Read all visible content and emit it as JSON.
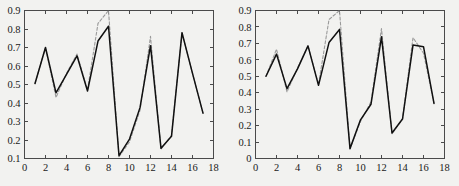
{
  "figure": {
    "background_color": "#f2f2f0",
    "panel_count": 2,
    "solid_color": "#111111",
    "dashed_color": "#9a9a9a"
  },
  "chart_data": [
    {
      "type": "line",
      "panel": "left",
      "title": "",
      "xlabel": "",
      "ylabel": "",
      "xlim": [
        0,
        18
      ],
      "ylim": [
        0.1,
        0.9
      ],
      "xticks": [
        0,
        2,
        4,
        6,
        8,
        10,
        12,
        14,
        16,
        18
      ],
      "xticklabels": [
        "0",
        "2",
        "4",
        "6",
        "8",
        "10",
        "12",
        "14",
        "16",
        "18"
      ],
      "yticks": [
        0.1,
        0.2,
        0.3,
        0.4,
        0.5,
        0.6,
        0.7,
        0.8,
        0.9
      ],
      "yticklabels": [
        "0.1",
        "0.2",
        "0.3",
        "0.4",
        "0.5",
        "0.6",
        "0.7",
        "0.8",
        "0.9"
      ],
      "grid": false,
      "legend": "none",
      "x": [
        1,
        2,
        3,
        4,
        5,
        6,
        7,
        8,
        9,
        10,
        11,
        12,
        13,
        14,
        15,
        16,
        17
      ],
      "series": [
        {
          "name": "solid",
          "style": "solid",
          "color": "#111111",
          "values": [
            0.505,
            0.7,
            0.455,
            0.555,
            0.655,
            0.465,
            0.735,
            0.815,
            0.115,
            0.205,
            0.375,
            0.71,
            0.155,
            0.22,
            0.78,
            0.56,
            0.345
          ]
        },
        {
          "name": "dashed",
          "style": "dashed",
          "color": "#9a9a9a",
          "values": [
            0.505,
            0.7,
            0.43,
            0.56,
            0.665,
            0.47,
            0.83,
            0.9,
            0.11,
            0.19,
            0.36,
            0.76,
            0.15,
            0.225,
            0.78,
            0.56,
            0.345
          ],
          "clipped_above": 0.9,
          "clipped_range_x": [
            7,
            8
          ]
        }
      ]
    },
    {
      "type": "line",
      "panel": "right",
      "title": "",
      "xlabel": "",
      "ylabel": "",
      "xlim": [
        0,
        18
      ],
      "ylim": [
        0,
        0.9
      ],
      "xticks": [
        0,
        2,
        4,
        6,
        8,
        10,
        12,
        14,
        16,
        18
      ],
      "xticklabels": [
        "0",
        "2",
        "4",
        "6",
        "8",
        "10",
        "12",
        "14",
        "16",
        "18"
      ],
      "yticks": [
        0,
        0.1,
        0.2,
        0.3,
        0.4,
        0.5,
        0.6,
        0.7,
        0.8,
        0.9
      ],
      "yticklabels": [
        "0",
        "0.1",
        "0.2",
        "0.3",
        "0.4",
        "0.5",
        "0.6",
        "0.7",
        "0.8",
        "0.9"
      ],
      "grid": false,
      "legend": "none",
      "x": [
        1,
        2,
        3,
        4,
        5,
        6,
        7,
        8,
        9,
        10,
        11,
        12,
        13,
        14,
        15,
        16,
        17
      ],
      "series": [
        {
          "name": "solid",
          "style": "solid",
          "color": "#111111",
          "values": [
            0.5,
            0.635,
            0.425,
            0.545,
            0.685,
            0.445,
            0.705,
            0.785,
            0.06,
            0.235,
            0.33,
            0.74,
            0.155,
            0.24,
            0.69,
            0.68,
            0.335
          ]
        },
        {
          "name": "dashed",
          "style": "dashed",
          "color": "#9a9a9a",
          "values": [
            0.5,
            0.665,
            0.405,
            0.55,
            0.685,
            0.45,
            0.845,
            0.9,
            0.06,
            0.225,
            0.345,
            0.79,
            0.15,
            0.24,
            0.735,
            0.64,
            0.335
          ],
          "clipped_above": 0.9,
          "clipped_range_x": [
            7,
            8
          ]
        }
      ]
    }
  ]
}
